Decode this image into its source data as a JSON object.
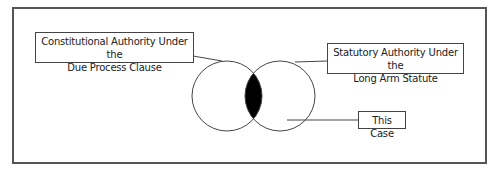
{
  "diagram": {
    "type": "venn",
    "labels": {
      "constitutional": {
        "line1": "Constitutional Authority Under the",
        "line2": "Due Process Clause"
      },
      "statutory": {
        "line1": "Statutory Authority Under the",
        "line2": "Long Arm Statute"
      },
      "this_case": "This Case"
    },
    "colors": {
      "frame": "#555555",
      "stroke": "#444444",
      "intersection_fill": "#000000",
      "background": "#ffffff"
    }
  }
}
